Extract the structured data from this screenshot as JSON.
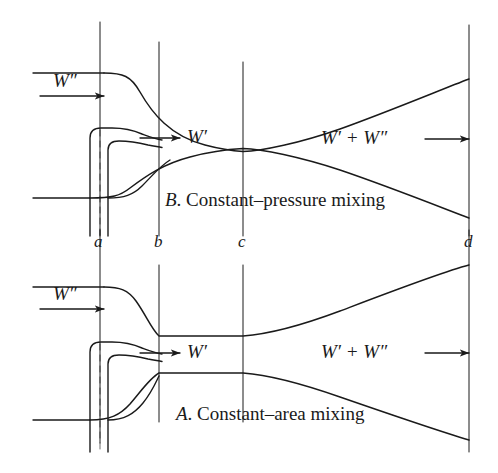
{
  "figure": {
    "background_color": "#ffffff",
    "line_color": "#1a1a1a",
    "width": 498,
    "height": 473
  },
  "stations": {
    "label_a": "a",
    "label_b": "b",
    "label_c": "c",
    "label_d": "d",
    "positions_px": {
      "a": 100,
      "b": 159,
      "c": 243,
      "d": 469
    },
    "label_y_px": 243
  },
  "diagrams": [
    {
      "id": "B",
      "caption_letter": "B",
      "caption_text": ". Constant–pressure mixing",
      "caption_full": "B. Constant–pressure mixing",
      "secondary_flow_label": "W",
      "secondary_flow_prime": "″",
      "primary_flow_label": "W",
      "primary_flow_prime": "′",
      "mixed_flow_label": "W′ + W″",
      "throat_station": "c",
      "description": "Converging–diverging duct with minimum area at station c"
    },
    {
      "id": "A",
      "caption_letter": "A",
      "caption_text": ". Constant–area mixing",
      "caption_full": "A. Constant–area mixing",
      "secondary_flow_label": "W",
      "secondary_flow_prime": "″",
      "primary_flow_label": "W",
      "primary_flow_prime": "′",
      "mixed_flow_label": "W′ + W″",
      "throat_station": "b–c",
      "description": "Constant area duct between stations b and c, then diverging diffuser to d"
    }
  ],
  "annotations": {
    "secondary_inlet_b": "W″",
    "primary_inlet_b": "W′",
    "mixed_outlet_b": "W′ + W″",
    "secondary_inlet_a": "W″",
    "primary_inlet_a": "W′",
    "mixed_outlet_a": "W′ + W″"
  }
}
